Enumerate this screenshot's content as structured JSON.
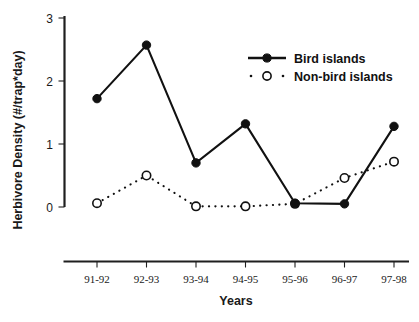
{
  "chart_data": {
    "type": "line",
    "title": "",
    "xlabel": "Years",
    "ylabel": "Herbivore Density (#/trap*day)",
    "categories": [
      "91-92",
      "92-93",
      "93-94",
      "94-95",
      "95-96",
      "96-97",
      "97-98"
    ],
    "ylim": [
      0,
      3
    ],
    "yticks": [
      "0",
      "1",
      "2",
      "3"
    ],
    "ytick_values": [
      0,
      1,
      2,
      3
    ],
    "grid": false,
    "legend_position": "top-right",
    "series": [
      {
        "name": "Bird islands",
        "marker": "filled-circle",
        "line_style": "solid",
        "color": "#111111",
        "values": [
          1.72,
          2.57,
          0.7,
          1.32,
          0.06,
          0.05,
          1.28
        ]
      },
      {
        "name": "Non-bird islands",
        "marker": "open-circle",
        "line_style": "dotted",
        "color": "#111111",
        "values": [
          0.06,
          0.5,
          0.01,
          0.01,
          0.05,
          0.46,
          0.72
        ]
      }
    ]
  },
  "axes": {
    "y_label": "Herbivore Density (#/trap*day)",
    "x_label": "Years",
    "y_tick_labels": [
      "3",
      "2",
      "1",
      "0"
    ],
    "x_tick_labels": [
      "91-92",
      "92-93",
      "93-94",
      "94-95",
      "95-96",
      "96-97",
      "97-98"
    ]
  },
  "legend": {
    "entries": [
      {
        "label": "Bird islands"
      },
      {
        "label": "Non-bird islands"
      }
    ]
  },
  "colors": {
    "ink": "#111111",
    "axis": "#1f1f1f",
    "background": "#ffffff"
  }
}
